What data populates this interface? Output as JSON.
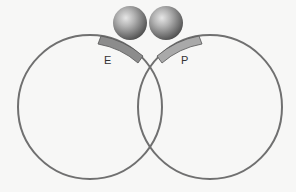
{
  "diagram": {
    "background": "#f7f7f6",
    "circles": [
      {
        "id": "left-circle",
        "cx": 90,
        "cy": 107,
        "r": 72,
        "stroke": "#707070"
      },
      {
        "id": "right-circle",
        "cx": 210,
        "cy": 107,
        "r": 72,
        "stroke": "#707070"
      }
    ],
    "sites": [
      {
        "id": "site-e",
        "label": "E",
        "fill": "#8c8c8c"
      },
      {
        "id": "site-p",
        "label": "P",
        "fill": "#a9a9a9"
      }
    ],
    "spheres": [
      {
        "id": "sphere-left",
        "cx": 130,
        "cy": 23,
        "r": 17
      },
      {
        "id": "sphere-right",
        "cx": 166,
        "cy": 23,
        "r": 17
      }
    ],
    "labels": {
      "e": "E",
      "p": "P"
    }
  }
}
